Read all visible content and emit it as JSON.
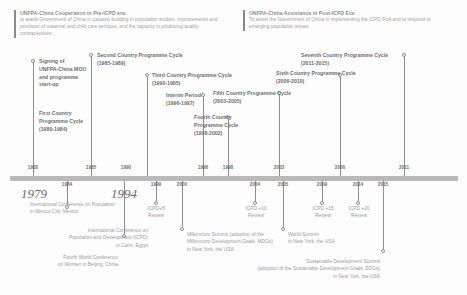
{
  "eras": [
    {
      "id": "pre-icpd",
      "title": "UNFPA-China Cooperation in Pre-ICPD era:",
      "description": "to assist Government of China in capacity building in population studies, improvements and provision of maternal and child care services, and the capacity in producing quality contraceptives"
    },
    {
      "id": "post-icpd",
      "title": "UNFPA-China Assistance in Post-ICPD Era:",
      "description": "To assist the Government of China in implementing the ICPD PoA and to respond to emerging population issues"
    }
  ],
  "axis": {
    "years_above": [
      "1980",
      "1985",
      "1990",
      "1996",
      "1998",
      "2003",
      "2006",
      "2011"
    ],
    "years_below": [
      "1984",
      "1999",
      "2000",
      "2004",
      "2005",
      "2009",
      "2014",
      "2015"
    ],
    "years_emphasis": [
      "1979",
      "1994"
    ]
  },
  "programme_cycles": [
    {
      "name": "Signing of\nUNFPA-China MOU\nand programme\nstart-up",
      "period": ""
    },
    {
      "name": "First Country\nProgramme Cycle",
      "period": "(1980-1984)"
    },
    {
      "name": "Second Country Programme Cycle",
      "period": "(1985-1989)"
    },
    {
      "name": "Third Country Programme Cycle",
      "period": "(1990-1995)"
    },
    {
      "name": "Interim Period",
      "period": "(1996-1997)"
    },
    {
      "name": "Fourth Country\nProgramme Cycle",
      "period": "(1998-2002)"
    },
    {
      "name": "Fifth Country Programme Cycle",
      "period": "(2003-2005)"
    },
    {
      "name": "Sixth Country Programme Cycle",
      "period": "(2006-2010)"
    },
    {
      "name": "Seventh Country Programme Cycle",
      "period": "(2011-2015)"
    }
  ],
  "events": [
    {
      "text": "International Conference on Population\nin Mexico City, Mexico"
    },
    {
      "text": "International Conference on\nPopulation and Development (ICPD)\nin Cairo, Egypt"
    },
    {
      "text": "Fourth World Conference\non Women in Beijing, China"
    },
    {
      "text": "ICPD+5\nReview"
    },
    {
      "text": "Millennium Summit (adoption of the\nMillennium Development Goals, MDGs)\nin New York, the USA"
    },
    {
      "text": "ICPD +10\nReview"
    },
    {
      "text": "World Summit\nin New York, the USA"
    },
    {
      "text": "ICPD +15\nReview"
    },
    {
      "text": "ICPD +20\nReview"
    },
    {
      "text": "Sustainable Development Summit\n(adoption of the Sustainable Development Goals, SDGs)\nin New York, the USA"
    }
  ],
  "colors": {
    "axis": "#b9b9b9",
    "tick": "#8e8e8e",
    "cycle_text": "#6e6e6e",
    "event_text": "#9b9b9b",
    "era_text": "#9a9a9a"
  }
}
